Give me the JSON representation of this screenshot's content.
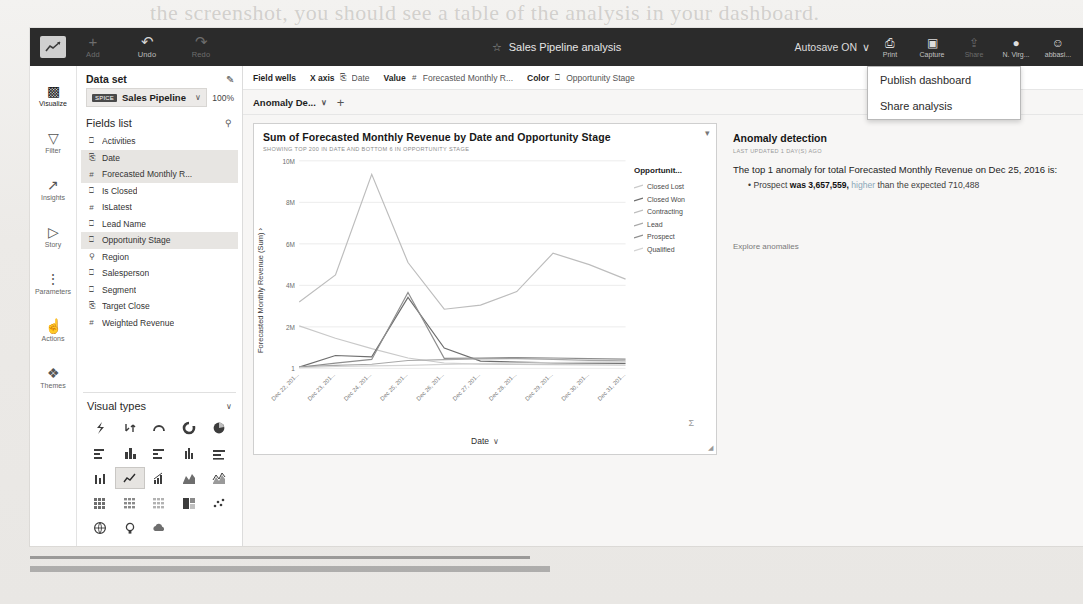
{
  "topbar": {
    "logo_icon": "quicksight-logo-icon",
    "buttons": [
      {
        "icon": "plus-icon",
        "label": "Add",
        "dim": true
      },
      {
        "icon": "undo-icon",
        "label": "Undo",
        "dim": false
      },
      {
        "icon": "redo-icon",
        "label": "Redo",
        "dim": true
      }
    ],
    "star_icon": "star-outline-icon",
    "analysis_title": "Sales Pipeline analysis",
    "autosave": "Autosave ON",
    "autosave_caret": "∨",
    "right_buttons": [
      {
        "icon": "print-icon",
        "label": "Print",
        "dim": false
      },
      {
        "icon": "capture-icon",
        "label": "Capture",
        "dim": false
      },
      {
        "icon": "share-icon",
        "label": "Share",
        "dim": true
      },
      {
        "icon": "region-pin-icon",
        "label": "N. Virg...",
        "dim": false
      },
      {
        "icon": "user-avatar-icon",
        "label": "abbasi...",
        "dim": false
      }
    ]
  },
  "share_menu": {
    "items": [
      "Publish dashboard",
      "Share analysis"
    ]
  },
  "rail": {
    "items": [
      {
        "icon": "bar-chart-icon",
        "label": "Visualize",
        "active": true
      },
      {
        "icon": "funnel-icon",
        "label": "Filter",
        "active": false
      },
      {
        "icon": "insights-line-icon",
        "label": "Insights",
        "active": false
      },
      {
        "icon": "story-play-icon",
        "label": "Story",
        "active": false
      },
      {
        "icon": "sliders-icon",
        "label": "Parameters",
        "active": false
      },
      {
        "icon": "cursor-action-icon",
        "label": "Actions",
        "active": false
      },
      {
        "icon": "paint-brush-icon",
        "label": "Themes",
        "active": false
      }
    ]
  },
  "dataset_panel": {
    "header": "Data set",
    "edit_icon": "pencil-icon",
    "badge": "SPICE",
    "name": "Sales Pipeline",
    "caret": "∨",
    "percent": "100%",
    "fields_header": "Fields list",
    "search_icon": "search-icon",
    "fields": [
      {
        "type": "string",
        "name": "Activities",
        "selected": false
      },
      {
        "type": "date",
        "name": "Date",
        "selected": true
      },
      {
        "type": "number",
        "name": "Forecasted Monthly R...",
        "selected": true
      },
      {
        "type": "string",
        "name": "Is Closed",
        "selected": false
      },
      {
        "type": "number",
        "name": "IsLatest",
        "selected": false
      },
      {
        "type": "string",
        "name": "Lead Name",
        "selected": false
      },
      {
        "type": "string",
        "name": "Opportunity Stage",
        "selected": true
      },
      {
        "type": "geo",
        "name": "Region",
        "selected": false
      },
      {
        "type": "string",
        "name": "Salesperson",
        "selected": false
      },
      {
        "type": "string",
        "name": "Segment",
        "selected": false
      },
      {
        "type": "date",
        "name": "Target Close",
        "selected": false
      },
      {
        "type": "number",
        "name": "Weighted Revenue",
        "selected": false
      }
    ]
  },
  "visual_types": {
    "header": "Visual types",
    "caret": "∨",
    "selected_index": 11,
    "items": [
      "autograph-icon",
      "kpi-icon",
      "gauge-icon",
      "donut-icon",
      "pie-icon",
      "horizontal-bar-icon",
      "vertical-bar-icon",
      "stacked-horizontal-bar-icon",
      "clustered-column-icon",
      "stacked-bar-icon",
      "combo-bar-icon",
      "line-chart-icon",
      "bar-line-combo-icon",
      "area-line-icon",
      "stacked-area-icon",
      "heat-map-icon",
      "pivot-table-icon",
      "table-icon",
      "tree-map-icon",
      "scatter-plot-icon",
      "geospatial-map-icon",
      "insight-bulb-icon",
      "word-cloud-icon"
    ]
  },
  "field_wells": {
    "label": "Field wells",
    "wells": [
      {
        "label": "X axis",
        "icon": "date-field-icon",
        "value": "Date"
      },
      {
        "label": "Value",
        "icon": "number-field-icon",
        "value": "Forecasted Monthly R..."
      },
      {
        "label": "Color",
        "icon": "string-field-icon",
        "value": "Opportunity Stage"
      }
    ]
  },
  "sheet_bar": {
    "sheet_name": "Anomaly De...",
    "caret": "∨",
    "add_icon": "plus-icon"
  },
  "chart_data": {
    "type": "line",
    "title": "Sum of Forecasted Monthly Revenue by Date and Opportunity Stage",
    "subtitle": "SHOWING TOP 200 IN DATE AND BOTTOM 6 IN OPPORTUNITY STAGE",
    "menu_icon": "chevron-down-icon",
    "xlabel": "Date",
    "xlabel_caret": "∨",
    "ylabel": "Forecasted Monthly Revenue (Sum) ›",
    "ylim": [
      0,
      10000000
    ],
    "yticks": [
      "1",
      "2M",
      "4M",
      "6M",
      "8M",
      "10M"
    ],
    "ytick_values": [
      0,
      2000000,
      4000000,
      6000000,
      8000000,
      10000000
    ],
    "grid": true,
    "legend_position": "right",
    "legend_title": "Opportunit...",
    "x": [
      "Dec 22, 201...",
      "Dec 23, 201...",
      "Dec 24, 201...",
      "Dec 25, 201...",
      "Dec 26, 201...",
      "Dec 27, 201...",
      "Dec 28, 201...",
      "Dec 29, 201...",
      "Dec 30, 201...",
      "Dec 31, 201..."
    ],
    "series": [
      {
        "name": "Closed Lost",
        "color": "#c9c9c9",
        "values": [
          2050000,
          1450000,
          950000,
          500000,
          260000,
          210000,
          190000,
          180000,
          170000,
          160000
        ]
      },
      {
        "name": "Closed Won",
        "color": "#6e6e6e",
        "values": [
          60000,
          620000,
          560000,
          3420000,
          980000,
          350000,
          300000,
          270000,
          250000,
          240000
        ]
      },
      {
        "name": "Contracting",
        "color": "#bdbdbd",
        "values": [
          3200000,
          4500000,
          9350000,
          5100000,
          2850000,
          3050000,
          3700000,
          5550000,
          5000000,
          4300000
        ]
      },
      {
        "name": "Lead",
        "color": "#a8a8a8",
        "values": [
          70000,
          140000,
          200000,
          380000,
          420000,
          460000,
          470000,
          430000,
          390000,
          360000
        ]
      },
      {
        "name": "Prospect",
        "color": "#8e8e8e",
        "values": [
          55000,
          250000,
          430000,
          3657559,
          480000,
          500000,
          520000,
          500000,
          470000,
          450000
        ]
      },
      {
        "name": "Qualified",
        "color": "#d3d3d3",
        "values": [
          40000,
          90000,
          120000,
          150000,
          190000,
          230000,
          260000,
          280000,
          300000,
          320000
        ]
      }
    ],
    "sigma_icon": "sum-sigma-icon",
    "resize_icon": "resize-handle-icon"
  },
  "anomaly": {
    "heading": "Anomaly detection",
    "updated": "LAST UPDATED 1 DAY(S) AGO",
    "sentence": "The top 1 anomaly for total Forecasted Monthly Revenue on Dec 25, 2016 is:",
    "bullet_prefix": "• Prospect ",
    "bullet_was": "was 3,657,559, ",
    "bullet_dir": "higher",
    "bullet_tail": " than the expected 710,488",
    "link": "Explore anomalies"
  }
}
